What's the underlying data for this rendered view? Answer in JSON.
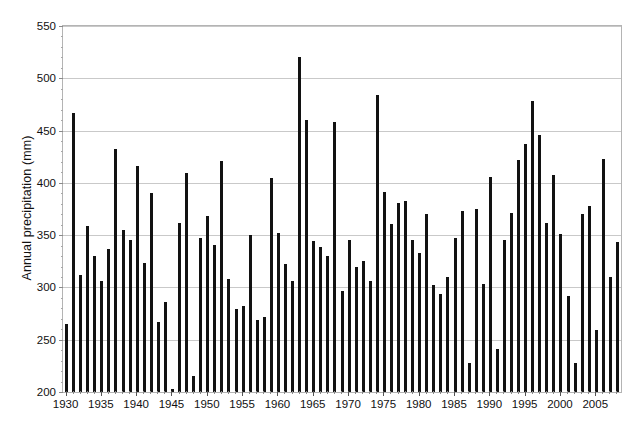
{
  "chart_data": {
    "type": "bar",
    "title": "",
    "xlabel": "",
    "ylabel": "Annual precipitation (mm)",
    "ylim": [
      200,
      550
    ],
    "ytick_step": 50,
    "yticks": [
      200,
      250,
      300,
      350,
      400,
      450,
      500,
      550
    ],
    "ytick_labels": [
      "200",
      "250",
      "300",
      "350",
      "400",
      "450",
      "500",
      "550"
    ],
    "xlim": [
      1929.5,
      2008.5
    ],
    "xticks": [
      1930,
      1935,
      1940,
      1945,
      1950,
      1955,
      1960,
      1965,
      1970,
      1975,
      1980,
      1985,
      1990,
      1995,
      2000,
      2005
    ],
    "xtick_labels": [
      "1930",
      "1935",
      "1940",
      "1945",
      "1950",
      "1955",
      "1960",
      "1965",
      "1970",
      "1975",
      "1980",
      "1985",
      "1990",
      "1995",
      "2000",
      "2005"
    ],
    "grid": true,
    "grid_axis": "y",
    "legend": false,
    "bar_color": "#121212",
    "categories": [
      1930,
      1931,
      1932,
      1933,
      1934,
      1935,
      1936,
      1937,
      1938,
      1939,
      1940,
      1941,
      1942,
      1943,
      1944,
      1945,
      1946,
      1947,
      1948,
      1949,
      1950,
      1951,
      1952,
      1953,
      1954,
      1955,
      1956,
      1957,
      1958,
      1959,
      1960,
      1961,
      1962,
      1963,
      1964,
      1965,
      1966,
      1967,
      1968,
      1969,
      1970,
      1971,
      1972,
      1973,
      1974,
      1975,
      1976,
      1977,
      1978,
      1979,
      1980,
      1981,
      1982,
      1983,
      1984,
      1985,
      1986,
      1987,
      1988,
      1989,
      1990,
      1991,
      1992,
      1993,
      1994,
      1995,
      1996,
      1997,
      1998,
      1999,
      2000,
      2001,
      2002,
      2003,
      2004,
      2005,
      2006,
      2007,
      2008
    ],
    "values": [
      265,
      467,
      312,
      359,
      330,
      306,
      337,
      432,
      355,
      345,
      416,
      323,
      390,
      267,
      286,
      203,
      362,
      409,
      215,
      347,
      368,
      341,
      421,
      308,
      279,
      282,
      350,
      269,
      272,
      405,
      352,
      322,
      306,
      520,
      460,
      344,
      339,
      330,
      458,
      297,
      345,
      320,
      325,
      306,
      484,
      391,
      361,
      381,
      383,
      345,
      333,
      370,
      302,
      294,
      310,
      347,
      373,
      228,
      375,
      303,
      406,
      241,
      345,
      371,
      422,
      437,
      478,
      446,
      362,
      408,
      351,
      292,
      228,
      370,
      378,
      259,
      423,
      310,
      343
    ],
    "values_unit": "mm",
    "n_bars": 79,
    "series_name": "Annual precipitation"
  }
}
